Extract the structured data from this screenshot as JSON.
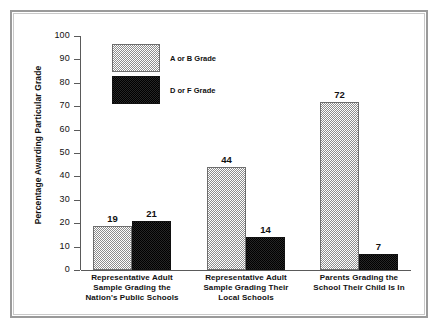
{
  "chart_data": {
    "type": "bar",
    "title": "",
    "xlabel": "",
    "ylabel": "Percentage Awarding Particular Grade",
    "ylim": [
      0,
      100
    ],
    "ytick_labels": [
      "100",
      "90",
      "80",
      "70",
      "60",
      "50",
      "40",
      "30",
      "20",
      "10",
      "0"
    ],
    "ytick_values": [
      100,
      90,
      80,
      70,
      60,
      50,
      40,
      30,
      20,
      10,
      0
    ],
    "grid": false,
    "legend_position": "upper-left-inside",
    "categories": [
      "Representative Adult\nSample Grading the\nNation's Public Schools",
      "Representative Adult\nSample Grading Their\nLocal Schools",
      "Parents Grading the\nSchool Their Child Is In"
    ],
    "series": [
      {
        "name": "A or B Grade",
        "values": [
          19,
          44,
          72
        ],
        "value_labels": [
          "19",
          "44",
          "72"
        ],
        "fill": "light-hatch"
      },
      {
        "name": "D or F Grade",
        "values": [
          21,
          14,
          7
        ],
        "value_labels": [
          "21",
          "14",
          "7"
        ],
        "fill": "solid-dark"
      }
    ]
  },
  "legend": {
    "items": [
      {
        "label": "A or B Grade",
        "style": "light"
      },
      {
        "label": "D or F Grade",
        "style": "dark"
      }
    ]
  },
  "colors": {
    "light_fill": "#8d8d8d",
    "dark_fill": "#181818",
    "axis": "#5a5a5a",
    "text": "#111111",
    "frame": "#9a9a9a",
    "background": "#ffffff"
  }
}
